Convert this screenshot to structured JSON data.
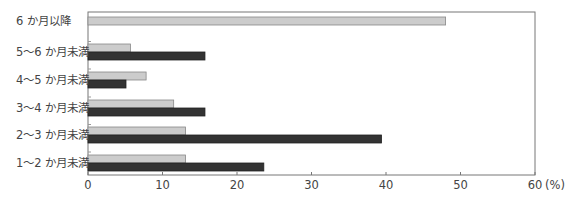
{
  "chart_data": {
    "type": "bar",
    "orientation": "horizontal",
    "title": "",
    "xlabel": "",
    "ylabel": "",
    "unit": "(%)",
    "categories": [
      "6 か月以降",
      "5〜6 か月未満",
      "4〜5 か月未満",
      "3〜4 か月未満",
      "2〜3 か月未満",
      "1〜2 か月未満"
    ],
    "series": [
      {
        "name": "series-light",
        "color": "#cccccc",
        "values": [
          48.0,
          5.7,
          7.8,
          11.5,
          13.1,
          13.1
        ]
      },
      {
        "name": "series-dark",
        "color": "#333333",
        "values": [
          null,
          15.7,
          5.1,
          15.7,
          39.4,
          23.6
        ]
      }
    ],
    "xlim": [
      0,
      60
    ],
    "xticks": [
      0,
      10,
      20,
      30,
      40,
      50,
      60
    ],
    "xtick_labels": [
      "0",
      "10",
      "20",
      "30",
      "40",
      "50",
      "60"
    ],
    "grid": false,
    "legend": "none"
  }
}
